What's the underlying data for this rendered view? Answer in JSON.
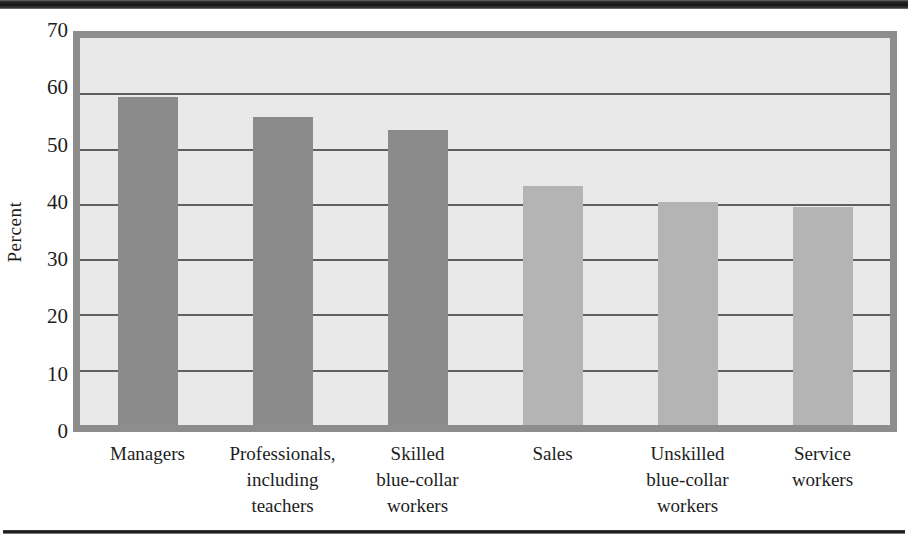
{
  "page": {
    "top_rule_visible": true,
    "bottom_rule_visible": true
  },
  "chart_data": {
    "type": "bar",
    "title": "",
    "xlabel": "",
    "ylabel": "Percent",
    "ylim": [
      0,
      70
    ],
    "ytick_values": [
      70,
      60,
      50,
      40,
      30,
      20,
      10,
      0
    ],
    "ytick_labels": [
      "70",
      "60",
      "50",
      "40",
      "30",
      "20",
      "10",
      "0"
    ],
    "grid": true,
    "grid_axis": "y",
    "legend": false,
    "legend_position": "none",
    "categories": [
      "Managers",
      "Professionals, including teachers",
      "Skilled blue-collar workers",
      "Sales",
      "Unskilled blue-collar workers",
      "Service workers"
    ],
    "category_label_lines": [
      [
        "Managers"
      ],
      [
        "Professionals,",
        "including",
        "teachers"
      ],
      [
        "Skilled",
        "blue-collar",
        "workers"
      ],
      [
        "Sales"
      ],
      [
        "Unskilled",
        "blue-collar",
        "workers"
      ],
      [
        "Service",
        "workers"
      ]
    ],
    "values": [
      59.3,
      55.7,
      53.4,
      43.3,
      40.4,
      39.4
    ],
    "value_labels": [
      "59.3",
      "55.7",
      "53.4",
      "43.3",
      "40.4",
      "39.4"
    ],
    "bar_colors": [
      "#8b8b8b",
      "#8b8b8b",
      "#8b8b8b",
      "#b4b4b4",
      "#b4b4b4",
      "#b4b4b4"
    ],
    "bar_shade_groups": [
      "dark",
      "dark",
      "dark",
      "light",
      "light",
      "light"
    ]
  },
  "colors": {
    "plot_background": "#e9e9e9",
    "plot_border": "#8d8d8d",
    "gridline": "#5f5f5f",
    "bar_dark": "#8b8b8b",
    "bar_light": "#b4b4b4",
    "text": "#1d1d1d",
    "rule": "#111111"
  }
}
